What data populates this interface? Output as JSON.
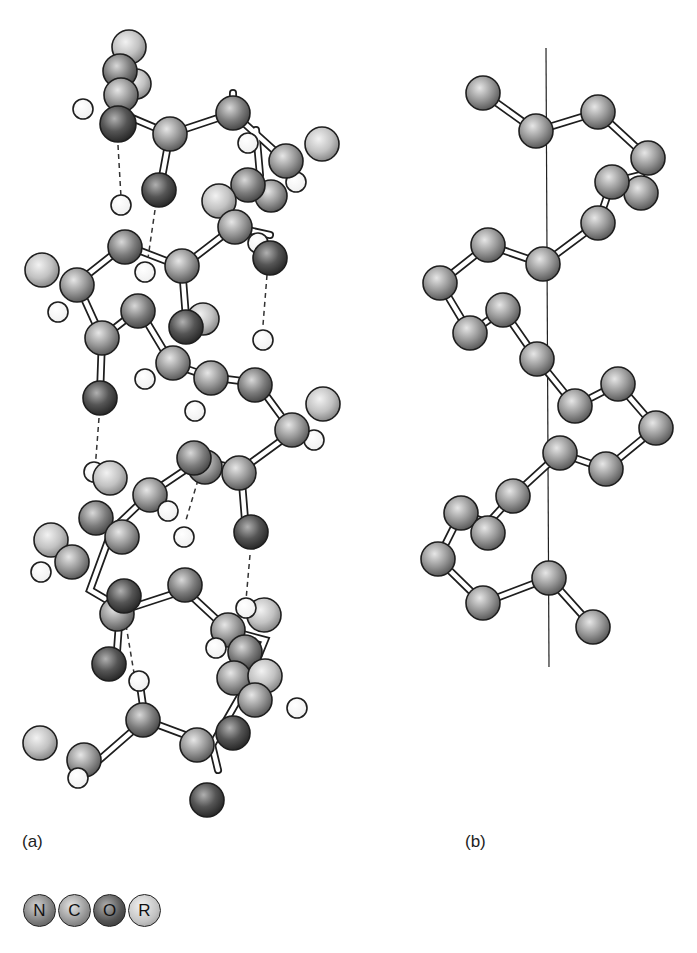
{
  "figure": {
    "panels": [
      {
        "id": "a",
        "label": "(a)",
        "description": "Ball-and-stick alpha helix with hydrogen bonds (dashed lines)"
      },
      {
        "id": "b",
        "label": "(b)",
        "description": "Backbone trace with helix axis (vertical line)"
      }
    ]
  },
  "legend": {
    "items": [
      {
        "symbol": "N",
        "name": "Nitrogen",
        "color": "#7a7a7a"
      },
      {
        "symbol": "C",
        "name": "Carbon",
        "color": "#8c8c8c"
      },
      {
        "symbol": "O",
        "name": "Oxygen",
        "color": "#555555"
      },
      {
        "symbol": "R",
        "name": "Side chain",
        "color": "#bdbdbd"
      }
    ]
  },
  "colors": {
    "nitrogen": "#7a7a7a",
    "carbon": "#8e8e8e",
    "oxygen": "#505050",
    "side_chain": "#bcbcbc",
    "hydrogen": "#ffffff",
    "outline": "#1e1e1e"
  }
}
